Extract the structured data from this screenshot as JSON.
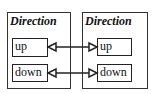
{
  "diagram": {
    "left": {
      "title": "Direction",
      "items": [
        {
          "label": "up"
        },
        {
          "label": "down"
        }
      ]
    },
    "right": {
      "title": "Direction",
      "items": [
        {
          "label": "up"
        },
        {
          "label": "down"
        }
      ]
    },
    "connections": [
      {
        "from": "left.up",
        "to": "right.up",
        "style": "bidirectional-hollow-triangle"
      },
      {
        "from": "left.down",
        "to": "right.down",
        "style": "bidirectional-hollow-triangle"
      }
    ]
  }
}
